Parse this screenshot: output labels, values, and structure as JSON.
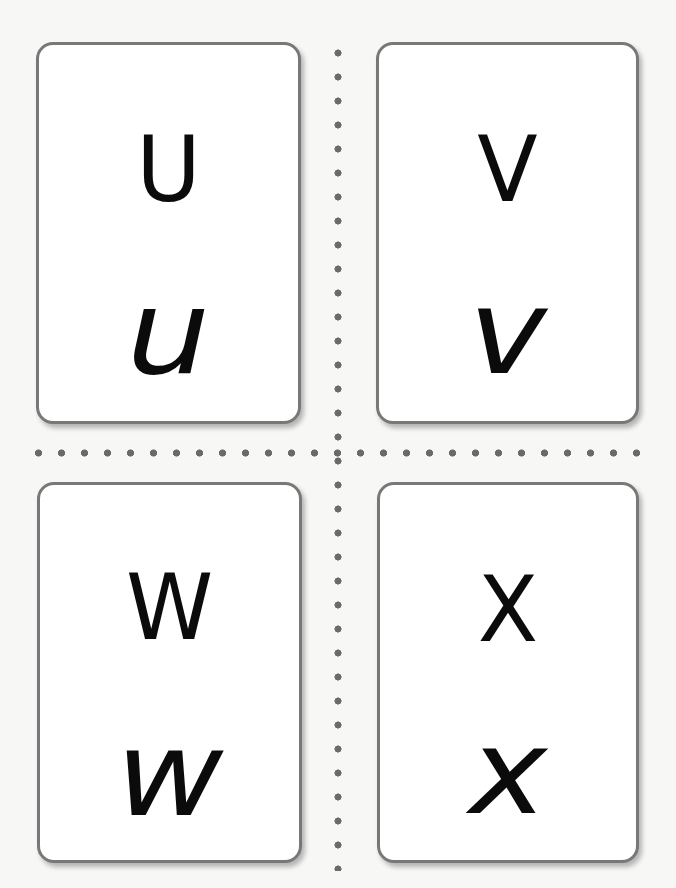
{
  "sheet": {
    "background_color": "#f7f7f6",
    "card_border_color": "#787878",
    "dot_color": "#6a6a6a",
    "cut_guides": {
      "vertical": "dotted-line",
      "horizontal": "dotted-line"
    }
  },
  "cards": [
    {
      "position": "top-left",
      "uppercase": "U",
      "lowercase": "u"
    },
    {
      "position": "top-right",
      "uppercase": "V",
      "lowercase": "v"
    },
    {
      "position": "bottom-left",
      "uppercase": "W",
      "lowercase": "w"
    },
    {
      "position": "bottom-right",
      "uppercase": "X",
      "lowercase": "x"
    }
  ]
}
